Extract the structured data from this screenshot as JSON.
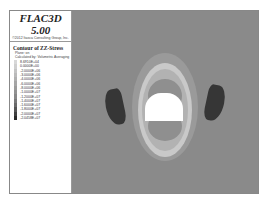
{
  "header": {
    "app_title": "FLAC3D 5.00",
    "company": "©2012 Itasca Consulting Group, Inc."
  },
  "legend": {
    "title": "Contour of ZZ-Stress",
    "plane": "Plane: on",
    "calculated_by": "Calculated by: Volumetric Averaging",
    "entries": [
      {
        "value": "8.6910E+04",
        "color": "#d8d8d8"
      },
      {
        "value": "0.0000E+00",
        "color": "#cfcfcf"
      },
      {
        "value": "-2.0000E+06",
        "color": "#c4c4c4"
      },
      {
        "value": "-3.0000E+06",
        "color": "#bababa"
      },
      {
        "value": "-4.0000E+06",
        "color": "#b0b0b0"
      },
      {
        "value": "-6.0000E+06",
        "color": "#a6a6a6"
      },
      {
        "value": "-8.0000E+06",
        "color": "#9c9c9c"
      },
      {
        "value": "-1.0000E+07",
        "color": "#929292"
      },
      {
        "value": "-1.2000E+07",
        "color": "#888888"
      },
      {
        "value": "-1.4000E+07",
        "color": "#7a7a7a"
      },
      {
        "value": "-1.6000E+07",
        "color": "#6a6a6a"
      },
      {
        "value": "-1.8000E+07",
        "color": "#555555"
      },
      {
        "value": "-2.0000E+07",
        "color": "#404040"
      },
      {
        "value": "-2.0458E+07",
        "color": "#2a2a2a"
      }
    ]
  },
  "plot": {
    "background_color": "#8a8a8a",
    "opening_color": "#ffffff",
    "high_stress_color": "#333333"
  }
}
